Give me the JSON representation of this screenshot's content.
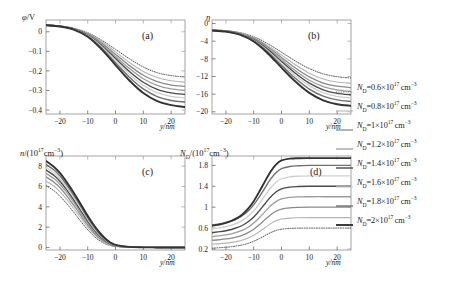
{
  "figure": {
    "background": "#ffffff",
    "panel_count": 4
  },
  "legend": {
    "position": "right",
    "entries": [
      {
        "label_prefix": "N",
        "label_sub": "D",
        "label_rest": "=0.6×10",
        "exp": "17",
        "unit": "cm",
        "unit_exp": "−3",
        "full": "N_D=0.6×10^17 cm^-3",
        "color": "#555555",
        "width": 1.0,
        "style": "dotted"
      },
      {
        "label_prefix": "N",
        "label_sub": "D",
        "label_rest": "=0.8×10",
        "exp": "17",
        "unit": "cm",
        "unit_exp": "−3",
        "full": "N_D=0.8×10^17 cm^-3",
        "color": "#b5b5b5",
        "width": 1.1,
        "style": "solid"
      },
      {
        "label_prefix": "N",
        "label_sub": "D",
        "label_rest": "=1×10",
        "exp": "17",
        "unit": "cm",
        "unit_exp": "−3",
        "full": "N_D=1×10^17 cm^-3",
        "color": "#8a8a8a",
        "width": 1.3,
        "style": "solid"
      },
      {
        "label_prefix": "N",
        "label_sub": "D",
        "label_rest": "=1.2×10",
        "exp": "17",
        "unit": "cm",
        "unit_exp": "−3",
        "full": "N_D=1.2×10^17 cm^-3",
        "color": "#9c9c9c",
        "width": 1.3,
        "style": "solid"
      },
      {
        "label_prefix": "N",
        "label_sub": "D",
        "label_rest": "=1.4×10",
        "exp": "17",
        "unit": "cm",
        "unit_exp": "−3",
        "full": "N_D=1.4×10^17 cm^-3",
        "color": "#4a4a4a",
        "width": 1.4,
        "style": "solid"
      },
      {
        "label_prefix": "N",
        "label_sub": "D",
        "label_rest": "=1.6×10",
        "exp": "17",
        "unit": "cm",
        "unit_exp": "−3",
        "full": "N_D=1.6×10^17 cm^-3",
        "color": "#cfcfcf",
        "width": 1.3,
        "style": "solid"
      },
      {
        "label_prefix": "N",
        "label_sub": "D",
        "label_rest": "=1.8×10",
        "exp": "17",
        "unit": "cm",
        "unit_exp": "−3",
        "full": "N_D=1.8×10^17 cm^-3",
        "color": "#707070",
        "width": 1.4,
        "style": "solid"
      },
      {
        "label_prefix": "N",
        "label_sub": "D",
        "label_rest": "=2×10",
        "exp": "17",
        "unit": "cm",
        "unit_exp": "−3",
        "full": "N_D=2×10^17 cm^-3",
        "color": "#333333",
        "width": 1.9,
        "style": "solid"
      }
    ]
  },
  "chart_data": [
    {
      "type": "line",
      "panel": "(a)",
      "title": "",
      "ylabel": "φ/V",
      "xlabel": "y/nm",
      "xlim": [
        -25,
        25
      ],
      "ylim": [
        -0.42,
        0.06
      ],
      "xticks": [
        -20,
        -10,
        0,
        10,
        20
      ],
      "xticklabels": [
        "−20",
        "−10",
        "0",
        "10",
        "20"
      ],
      "yticks": [
        0,
        -0.1,
        -0.2,
        -0.3,
        -0.4
      ],
      "yticklabels": [
        "0",
        "−0.1",
        "−0.2",
        "−0.3",
        "−0.4"
      ],
      "grid": false,
      "x": [
        -25,
        -20,
        -15,
        -10,
        -5,
        0,
        5,
        10,
        15,
        20,
        25
      ],
      "series": [
        {
          "name": "N_D=0.6×10^17 cm^-3",
          "values": [
            0.035,
            0.03,
            0.018,
            -0.005,
            -0.043,
            -0.09,
            -0.138,
            -0.18,
            -0.209,
            -0.224,
            -0.231
          ]
        },
        {
          "name": "N_D=0.8×10^17 cm^-3",
          "values": [
            0.035,
            0.03,
            0.017,
            -0.008,
            -0.05,
            -0.103,
            -0.157,
            -0.203,
            -0.234,
            -0.25,
            -0.257
          ]
        },
        {
          "name": "N_D=1×10^17 cm^-3",
          "values": [
            0.034,
            0.029,
            0.016,
            -0.011,
            -0.057,
            -0.115,
            -0.173,
            -0.222,
            -0.255,
            -0.272,
            -0.279
          ]
        },
        {
          "name": "N_D=1.2×10^17 cm^-3",
          "values": [
            0.034,
            0.029,
            0.015,
            -0.014,
            -0.063,
            -0.126,
            -0.188,
            -0.24,
            -0.274,
            -0.292,
            -0.299
          ]
        },
        {
          "name": "N_D=1.4×10^17 cm^-3",
          "values": [
            0.034,
            0.028,
            0.014,
            -0.017,
            -0.07,
            -0.137,
            -0.203,
            -0.258,
            -0.294,
            -0.312,
            -0.32
          ]
        },
        {
          "name": "N_D=1.6×10^17 cm^-3",
          "values": [
            0.033,
            0.028,
            0.013,
            -0.02,
            -0.076,
            -0.147,
            -0.217,
            -0.274,
            -0.311,
            -0.33,
            -0.338
          ]
        },
        {
          "name": "N_D=1.8×10^17 cm^-3",
          "values": [
            0.033,
            0.027,
            0.012,
            -0.023,
            -0.083,
            -0.158,
            -0.232,
            -0.292,
            -0.331,
            -0.351,
            -0.359
          ]
        },
        {
          "name": "N_D=2×10^17 cm^-3",
          "values": [
            0.033,
            0.027,
            0.011,
            -0.026,
            -0.09,
            -0.17,
            -0.249,
            -0.313,
            -0.354,
            -0.375,
            -0.384
          ]
        }
      ]
    },
    {
      "type": "line",
      "panel": "(b)",
      "title": "",
      "ylabel": "η",
      "xlabel": "y/nm",
      "xlim": [
        -25,
        25
      ],
      "ylim": [
        -20.5,
        0.8
      ],
      "xticks": [
        -20,
        -10,
        0,
        10,
        20
      ],
      "xticklabels": [
        "−20",
        "−10",
        "0",
        "10",
        "20"
      ],
      "yticks": [
        0,
        -4,
        -8,
        -12,
        -16,
        -20
      ],
      "yticklabels": [
        "0",
        "−4",
        "−8",
        "−12",
        "−16",
        "−20"
      ],
      "grid": false,
      "x": [
        -25,
        -20,
        -15,
        -10,
        -5,
        0,
        5,
        10,
        15,
        20,
        25
      ],
      "series": [
        {
          "name": "N_D=0.6×10^17 cm^-3",
          "values": [
            -1.45,
            -1.6,
            -2.05,
            -3.0,
            -4.55,
            -6.5,
            -8.5,
            -10.2,
            -11.4,
            -12.05,
            -12.35
          ]
        },
        {
          "name": "N_D=0.8×10^17 cm^-3",
          "values": [
            -1.48,
            -1.65,
            -2.15,
            -3.2,
            -4.95,
            -7.15,
            -9.35,
            -11.25,
            -12.55,
            -13.25,
            -13.55
          ]
        },
        {
          "name": "N_D=1×10^17 cm^-3",
          "values": [
            -1.5,
            -1.68,
            -2.22,
            -3.38,
            -5.28,
            -7.68,
            -10.08,
            -12.1,
            -13.48,
            -14.2,
            -14.52
          ]
        },
        {
          "name": "N_D=1.2×10^17 cm^-3",
          "values": [
            -1.52,
            -1.71,
            -2.28,
            -3.52,
            -5.58,
            -8.15,
            -10.7,
            -12.85,
            -14.28,
            -15.05,
            -15.38
          ]
        },
        {
          "name": "N_D=1.4×10^17 cm^-3",
          "values": [
            -1.54,
            -1.74,
            -2.34,
            -3.66,
            -5.86,
            -8.6,
            -11.28,
            -13.52,
            -15.02,
            -15.82,
            -16.15
          ]
        },
        {
          "name": "N_D=1.6×10^17 cm^-3",
          "values": [
            -1.56,
            -1.77,
            -2.4,
            -3.78,
            -6.1,
            -9.0,
            -11.8,
            -14.12,
            -15.68,
            -16.5,
            -16.85
          ]
        },
        {
          "name": "N_D=1.8×10^17 cm^-3",
          "values": [
            -1.58,
            -1.8,
            -2.46,
            -3.92,
            -6.38,
            -9.45,
            -12.4,
            -14.85,
            -16.45,
            -17.3,
            -17.65
          ]
        },
        {
          "name": "N_D=2×10^17 cm^-3",
          "values": [
            -1.6,
            -1.83,
            -2.52,
            -4.08,
            -6.72,
            -10.0,
            -13.15,
            -15.72,
            -17.4,
            -18.28,
            -18.65
          ]
        }
      ]
    },
    {
      "type": "line",
      "panel": "(c)",
      "title": "",
      "ylabel": "n/(10¹⁷cm⁻³)",
      "xlabel": "y/nm",
      "xlim": [
        -25,
        25
      ],
      "ylim": [
        -0.25,
        9.0
      ],
      "xticks": [
        -20,
        -10,
        0,
        10,
        20
      ],
      "xticklabels": [
        "−20",
        "−10",
        "0",
        "10",
        "20"
      ],
      "yticks": [
        0,
        2,
        4,
        6,
        8
      ],
      "yticklabels": [
        "0",
        "2",
        "4",
        "6",
        "8"
      ],
      "grid": false,
      "x": [
        -25,
        -22,
        -20,
        -18,
        -16,
        -14,
        -12,
        -10,
        -8,
        -6,
        -4,
        -2,
        0,
        5,
        10,
        15,
        20,
        25
      ],
      "series": [
        {
          "name": "N_D=0.6×10^17 cm^-3",
          "values": [
            6.1,
            5.55,
            5.05,
            4.45,
            3.8,
            3.1,
            2.4,
            1.75,
            1.18,
            0.72,
            0.4,
            0.2,
            0.09,
            0.02,
            0.005,
            0.001,
            0.0,
            0.0
          ]
        },
        {
          "name": "N_D=0.8×10^17 cm^-3",
          "values": [
            6.55,
            6.0,
            5.5,
            4.88,
            4.18,
            3.45,
            2.7,
            2.0,
            1.38,
            0.87,
            0.5,
            0.25,
            0.12,
            0.025,
            0.006,
            0.001,
            0.0,
            0.0
          ]
        },
        {
          "name": "N_D=1×10^17 cm^-3",
          "values": [
            6.95,
            6.4,
            5.9,
            5.25,
            4.52,
            3.76,
            2.97,
            2.22,
            1.55,
            1.0,
            0.58,
            0.3,
            0.14,
            0.03,
            0.007,
            0.002,
            0.0,
            0.0
          ]
        },
        {
          "name": "N_D=1.2×10^17 cm^-3",
          "values": [
            7.3,
            6.75,
            6.22,
            5.56,
            4.82,
            4.03,
            3.21,
            2.42,
            1.71,
            1.12,
            0.66,
            0.34,
            0.16,
            0.035,
            0.008,
            0.002,
            0.0,
            0.0
          ]
        },
        {
          "name": "N_D=1.4×10^17 cm^-3",
          "values": [
            7.62,
            7.05,
            6.52,
            5.84,
            5.08,
            4.27,
            3.43,
            2.6,
            1.86,
            1.23,
            0.74,
            0.39,
            0.19,
            0.04,
            0.009,
            0.002,
            0.0,
            0.0
          ]
        },
        {
          "name": "N_D=1.6×10^17 cm^-3",
          "values": [
            7.9,
            7.33,
            6.79,
            6.1,
            5.32,
            4.49,
            3.63,
            2.77,
            1.99,
            1.33,
            0.81,
            0.43,
            0.21,
            0.045,
            0.01,
            0.002,
            0.0,
            0.0
          ]
        },
        {
          "name": "N_D=1.8×10^17 cm^-3",
          "values": [
            8.18,
            7.6,
            7.05,
            6.34,
            5.55,
            4.7,
            3.82,
            2.93,
            2.13,
            1.43,
            0.88,
            0.47,
            0.23,
            0.05,
            0.011,
            0.003,
            0.0,
            0.0
          ]
        },
        {
          "name": "N_D=2×10^17 cm^-3",
          "values": [
            8.5,
            7.9,
            7.33,
            6.61,
            5.8,
            4.93,
            4.03,
            3.11,
            2.28,
            1.55,
            0.96,
            0.52,
            0.26,
            0.056,
            0.012,
            0.003,
            0.0,
            0.0
          ]
        }
      ]
    },
    {
      "type": "line",
      "panel": "(d)",
      "title": "",
      "ylabel": "N_D/(10¹⁷cm⁻³)",
      "xlabel": "y/nm",
      "xlim": [
        -25,
        25
      ],
      "ylim": [
        0.18,
        1.98
      ],
      "xticks": [
        -20,
        -10,
        0,
        10,
        20
      ],
      "xticklabels": [
        "−20",
        "−10",
        "0",
        "10",
        "20"
      ],
      "yticks": [
        0.2,
        0.6,
        1.0,
        1.4,
        1.8
      ],
      "yticklabels": [
        "0.2",
        "0.6",
        "1",
        "1.4",
        "1.8"
      ],
      "grid": false,
      "x": [
        -25,
        -22,
        -20,
        -18,
        -16,
        -14,
        -12,
        -10,
        -8,
        -6,
        -4,
        -2,
        0,
        3,
        6,
        10,
        15,
        20,
        25
      ],
      "series": [
        {
          "name": "N_D=0.6×10^17 cm^-3",
          "values": [
            0.215,
            0.225,
            0.233,
            0.243,
            0.258,
            0.278,
            0.307,
            0.347,
            0.398,
            0.455,
            0.51,
            0.553,
            0.578,
            0.593,
            0.598,
            0.6,
            0.6,
            0.6,
            0.6
          ]
        },
        {
          "name": "N_D=0.8×10^17 cm^-3",
          "values": [
            0.29,
            0.302,
            0.312,
            0.326,
            0.345,
            0.372,
            0.41,
            0.462,
            0.53,
            0.606,
            0.68,
            0.738,
            0.772,
            0.791,
            0.797,
            0.8,
            0.8,
            0.8,
            0.8
          ]
        },
        {
          "name": "N_D=1×10^17 cm^-3",
          "values": [
            0.363,
            0.378,
            0.391,
            0.408,
            0.432,
            0.466,
            0.513,
            0.578,
            0.663,
            0.758,
            0.85,
            0.922,
            0.965,
            0.988,
            0.996,
            1.0,
            1.0,
            1.0,
            1.0
          ]
        },
        {
          "name": "N_D=1.2×10^17 cm^-3",
          "values": [
            0.437,
            0.455,
            0.47,
            0.491,
            0.52,
            0.56,
            0.617,
            0.695,
            0.797,
            0.91,
            1.021,
            1.107,
            1.158,
            1.186,
            1.196,
            1.2,
            1.2,
            1.2,
            1.2
          ]
        },
        {
          "name": "N_D=1.4×10^17 cm^-3",
          "values": [
            0.511,
            0.531,
            0.549,
            0.573,
            0.607,
            0.654,
            0.72,
            0.811,
            0.93,
            1.062,
            1.191,
            1.291,
            1.351,
            1.384,
            1.395,
            1.4,
            1.4,
            1.4,
            1.4
          ]
        },
        {
          "name": "N_D=1.6×10^17 cm^-3",
          "values": [
            0.585,
            0.608,
            0.628,
            0.656,
            0.694,
            0.748,
            0.824,
            0.928,
            1.064,
            1.215,
            1.362,
            1.476,
            1.544,
            1.582,
            1.594,
            1.6,
            1.6,
            1.6,
            1.6
          ]
        },
        {
          "name": "N_D=1.8×10^17 cm^-3",
          "values": [
            0.659,
            0.684,
            0.707,
            0.738,
            0.781,
            0.842,
            0.927,
            1.044,
            1.197,
            1.367,
            1.532,
            1.66,
            1.737,
            1.78,
            1.793,
            1.8,
            1.8,
            1.8,
            1.8
          ]
        },
        {
          "name": "N_D=2×10^17 cm^-3",
          "values": [
            0.645,
            0.672,
            0.698,
            0.736,
            0.79,
            0.866,
            0.972,
            1.115,
            1.295,
            1.49,
            1.675,
            1.815,
            1.895,
            1.93,
            1.938,
            1.94,
            1.94,
            1.94,
            1.94
          ]
        }
      ]
    }
  ]
}
